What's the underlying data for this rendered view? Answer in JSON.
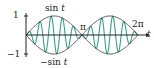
{
  "chart_data": {
    "type": "line",
    "title": "",
    "xlabel": "t",
    "ylabel": "",
    "xlim": [
      0,
      6.2832
    ],
    "ylim": [
      -1,
      1
    ],
    "grid": false,
    "x_ticks": [
      {
        "value": 3.1416,
        "label": "π"
      },
      {
        "value": 6.2832,
        "label": "2π"
      }
    ],
    "y_ticks": [
      {
        "value": 1,
        "label": "1"
      },
      {
        "value": -1,
        "label": "−1"
      }
    ],
    "series": [
      {
        "name": "sin t",
        "expression": "sin(t)",
        "color": "#333333",
        "role": "envelope"
      },
      {
        "name": "−sin t",
        "expression": "-sin(t)",
        "color": "#333333",
        "role": "envelope"
      },
      {
        "name": "sin t · sin 10t",
        "expression": "sin(t)*sin(10t)",
        "color": "#3a9e8c",
        "role": "modulated"
      }
    ],
    "annotations": [
      {
        "text": "sin t",
        "position": "top-center-left"
      },
      {
        "text": "−sin t",
        "position": "bottom-center-left"
      },
      {
        "text": "π",
        "position": "axis-crossing"
      },
      {
        "text": "2π",
        "position": "axis-end"
      }
    ]
  },
  "labels": {
    "y_top": "1",
    "y_bottom": "−1",
    "sin_top": "sin",
    "sin_top_var": "t",
    "sin_bottom": "−sin",
    "sin_bottom_var": "t",
    "pi": "π",
    "two_pi": "2π",
    "t_axis": "t"
  },
  "layout": {
    "x0": 26,
    "x1": 138,
    "y0": 35,
    "amp": 19,
    "freq": 10,
    "envelope_color": "#333333",
    "wave_color": "#3a9e8c",
    "axis_color": "#222222"
  }
}
